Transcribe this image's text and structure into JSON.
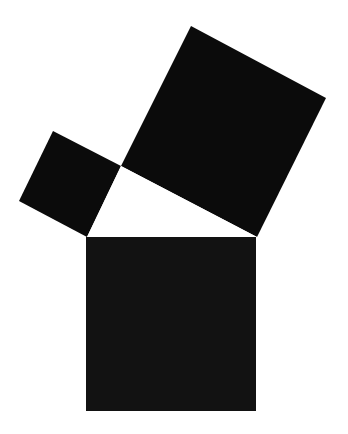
{
  "diagram": {
    "title": "",
    "background": "#ffffff",
    "shapes": [
      {
        "id": "square-leg-a",
        "fill": "#0b0b0b",
        "points": [
          [
            53,
            131
          ],
          [
            121,
            166
          ],
          [
            87,
            237
          ],
          [
            19,
            201
          ]
        ]
      },
      {
        "id": "square-leg-b",
        "fill": "#0b0b0b",
        "points": [
          [
            191,
            26
          ],
          [
            326,
            98
          ],
          [
            257,
            237
          ],
          [
            121,
            166
          ]
        ]
      },
      {
        "id": "square-hypotenuse",
        "fill": "#121212",
        "points": [
          [
            86,
            237
          ],
          [
            256,
            237
          ],
          [
            256,
            411
          ],
          [
            86,
            411
          ]
        ]
      },
      {
        "id": "right-triangle",
        "fill": "#ffffff",
        "points": [
          [
            121,
            166
          ],
          [
            257,
            237
          ],
          [
            87,
            237
          ]
        ]
      }
    ]
  }
}
